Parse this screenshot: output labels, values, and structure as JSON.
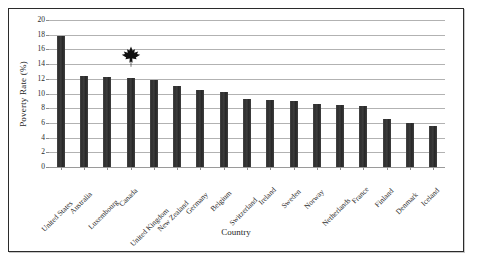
{
  "figure": {
    "x_axis_title": "Country",
    "y_axis_title": "Poverty Rate (%)",
    "marker": {
      "name": "maple-leaf-icon",
      "over_category": "Canada",
      "value_position": 15,
      "color": "#111111"
    },
    "frame_color": "#2b2b2b",
    "bar_color": "#3a3a3a",
    "gridline_color": "#b2b2b2"
  },
  "chart_data": {
    "type": "bar",
    "title": "",
    "xlabel": "Country",
    "ylabel": "Poverty Rate (%)",
    "ylim": [
      0,
      20
    ],
    "yticks": [
      0,
      2,
      4,
      6,
      8,
      10,
      12,
      14,
      16,
      18,
      20
    ],
    "grid": true,
    "legend": false,
    "categories": [
      "United States",
      "Australia",
      "Luxembourg",
      "Canada",
      "United Kingdom",
      "New Zealand",
      "Germany",
      "Belgium",
      "Switzerland",
      "Ireland",
      "Sweden",
      "Norway",
      "Netherlands",
      "France",
      "Finland",
      "Denmark",
      "Iceland"
    ],
    "values": [
      17.8,
      12.4,
      12.2,
      12.1,
      11.8,
      11.0,
      10.5,
      10.2,
      9.3,
      9.1,
      9.0,
      8.6,
      8.5,
      8.3,
      6.6,
      6.0,
      5.6
    ]
  }
}
